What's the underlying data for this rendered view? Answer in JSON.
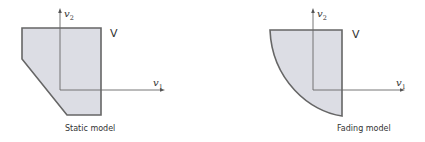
{
  "figure": {
    "panels": [
      {
        "id": "static",
        "caption": "Static model",
        "region_label": "V",
        "axis_x_label": "v",
        "axis_x_sub": "1",
        "axis_y_label": "v",
        "axis_y_sub": "2",
        "shape": "pentagon (rectangle with lower-left corner cut diagonally)"
      },
      {
        "id": "fading",
        "caption": "Fading model",
        "region_label": "V",
        "axis_x_label": "v",
        "axis_x_sub": "1",
        "axis_y_label": "v",
        "axis_y_sub": "2",
        "shape": "rectangle with lower-left boundary curved (quarter-ellipse arc)"
      }
    ],
    "colors": {
      "region_fill": "#dcdde4",
      "region_stroke": "#666666",
      "axis": "#666666",
      "text": "#333333",
      "background": "#ffffff"
    }
  }
}
